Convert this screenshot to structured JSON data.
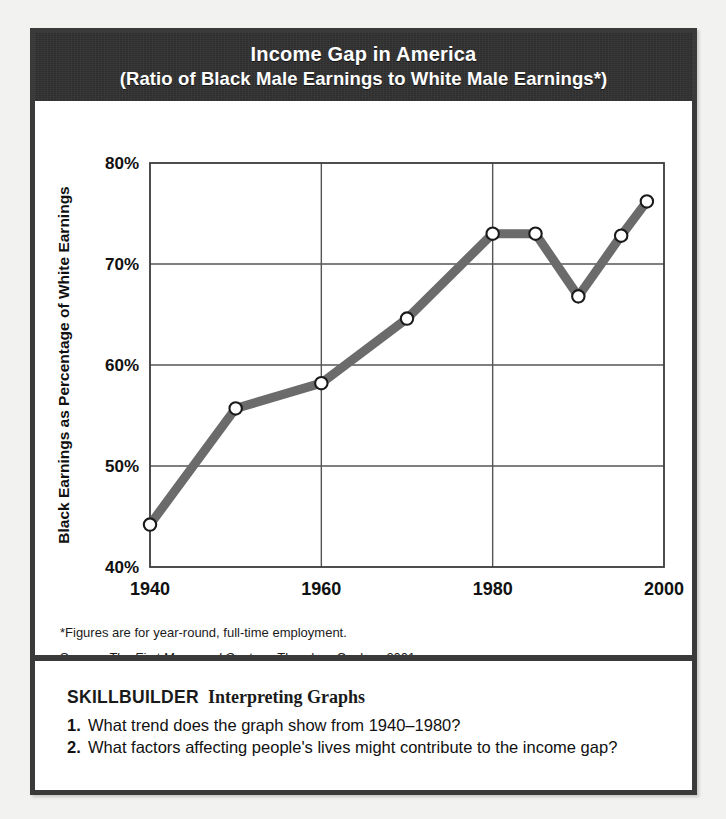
{
  "header": {
    "title_line1": "Income Gap in America",
    "title_line2": "(Ratio of Black Male Earnings to White Male Earnings*)",
    "band_color": "#2e2e2e"
  },
  "chart_data": {
    "type": "line",
    "title": "Income Gap in America",
    "subtitle": "(Ratio of Black Male Earnings to White Male Earnings*)",
    "xlabel": "",
    "ylabel": "Black Earnings as Percentage of White Earnings",
    "x": [
      1940,
      1950,
      1960,
      1970,
      1980,
      1985,
      1990,
      1995,
      1998
    ],
    "values": [
      44.2,
      55.7,
      58.2,
      64.6,
      73.0,
      73.0,
      66.8,
      72.8,
      76.2
    ],
    "xlim": [
      1940,
      2000
    ],
    "ylim": [
      40,
      80
    ],
    "xticks": [
      1940,
      1960,
      1980,
      2000
    ],
    "xtick_labels": [
      "1940",
      "1960",
      "1980",
      "2000"
    ],
    "yticks": [
      40,
      50,
      60,
      70,
      80
    ],
    "ytick_labels": [
      "40%",
      "50%",
      "60%",
      "70%",
      "80%"
    ],
    "grid": true,
    "legend": "none",
    "line_color": "#6b6b6b",
    "marker": "open-circle",
    "marker_face_color": "#ffffff",
    "marker_edge_color": "#1a1a1a",
    "plot_bg": "#ffffff",
    "grid_color": "#555555"
  },
  "notes": {
    "footnote": "*Figures are for year-round, full-time employment.",
    "source_prefix": "Source: ",
    "source_title": "The First Measured Century",
    "source_rest": ", Theodore Caplow, 2001"
  },
  "skillbuilder": {
    "label": "SKILLBUILDER",
    "subtitle": "Interpreting Graphs",
    "questions": [
      {
        "number": "1.",
        "text": "What trend does the graph show from 1940–1980?"
      },
      {
        "number": "2.",
        "text": "What factors affecting people's lives might contribute to the income gap?"
      }
    ]
  }
}
